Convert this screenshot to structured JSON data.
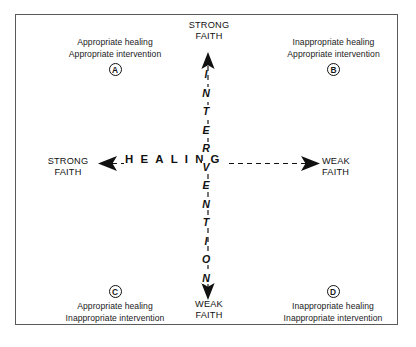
{
  "figure": {
    "frame_color": "#5a5a5a",
    "text_color": "#111111"
  },
  "axes": {
    "vertical": {
      "word": "INTERVENTION",
      "letters": [
        "I",
        "N",
        "T",
        "E",
        "R",
        "V",
        "E",
        "N",
        "T",
        "I",
        "O",
        "N"
      ],
      "top_label_line1": "STRONG",
      "top_label_line2": "FAITH",
      "bottom_label_line1": "WEAK",
      "bottom_label_line2": "FAITH"
    },
    "horizontal": {
      "word": "HEALING",
      "left_label_line1": "STRONG",
      "left_label_line2": "FAITH",
      "right_label_line1": "WEAK",
      "right_label_line2": "FAITH"
    }
  },
  "quadrants": [
    {
      "id": "A",
      "badge": "A",
      "position": "top-left",
      "line1": "Appropriate healing",
      "line2": "Appropriate intervention"
    },
    {
      "id": "B",
      "badge": "B",
      "position": "top-right",
      "line1": "Inappropriate healing",
      "line2": "Appropriate intervention"
    },
    {
      "id": "C",
      "badge": "C",
      "position": "bottom-left",
      "line1": "Appropriate healing",
      "line2": "Inappropriate intervention"
    },
    {
      "id": "D",
      "badge": "D",
      "position": "bottom-right",
      "line1": "Inappropriate healing",
      "line2": "Inappropriate intervention"
    }
  ]
}
